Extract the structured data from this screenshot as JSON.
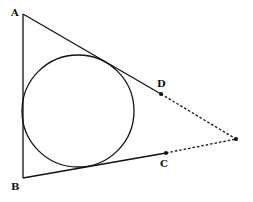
{
  "diagram": {
    "type": "geometry",
    "labels": {
      "A": "A",
      "B": "B",
      "C": "C",
      "D": "D"
    },
    "points": {
      "A": [
        23,
        14
      ],
      "B": [
        23,
        178
      ],
      "C": [
        166,
        153
      ],
      "D": [
        161,
        94
      ],
      "P": [
        236,
        139
      ]
    },
    "circle": {
      "cx": 78,
      "cy": 111,
      "r": 56
    },
    "colors": {
      "stroke": "#111111"
    }
  }
}
